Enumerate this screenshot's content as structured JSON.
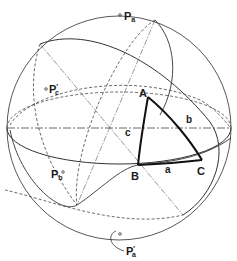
{
  "figure": {
    "colors": {
      "line": "#333333",
      "triangle": "#111111",
      "background": "#ffffff"
    }
  },
  "vertices": {
    "A": {
      "label": "A"
    },
    "B": {
      "label": "B"
    },
    "C": {
      "label": "C"
    }
  },
  "sides": {
    "a": {
      "label": "a"
    },
    "b": {
      "label": "b"
    },
    "c": {
      "label": "c"
    }
  },
  "poles": {
    "Pa": {
      "main": "P",
      "sub": "a",
      "prime": ""
    },
    "Pb": {
      "main": "P",
      "sub": "b",
      "prime": ""
    },
    "Pc_prime": {
      "main": "P",
      "sub": "c",
      "prime": "′"
    },
    "Pa_prime": {
      "main": "P",
      "sub": "a",
      "prime": "′"
    }
  }
}
